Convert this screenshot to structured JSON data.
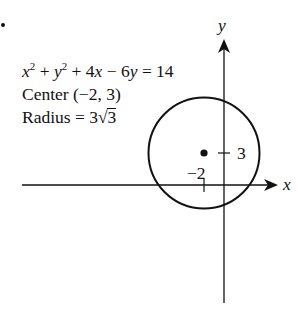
{
  "figure": {
    "bullet": "•",
    "equation": {
      "x_var": "x",
      "x_exp": "2",
      "plus1": " + ",
      "y_var": "y",
      "y_exp": "2",
      "plus2": " + 4",
      "x_var2": "x",
      "minus": " − 6",
      "y_var2": "y",
      "rhs": " = 14"
    },
    "center_label": "Center (−2, 3)",
    "radius_label_prefix": "Radius = 3",
    "radius_sqrt_sign": "√",
    "radius_sqrt_arg": "3"
  },
  "axes": {
    "x_label": "x",
    "y_label": "y",
    "x_tick_label": "−2",
    "y_tick_label": "3"
  },
  "colors": {
    "stroke": "#111111",
    "background": "#ffffff"
  },
  "geometry": {
    "circle_center": [
      -2,
      3
    ],
    "radius": "3√3",
    "radius_approx": 5.196
  }
}
